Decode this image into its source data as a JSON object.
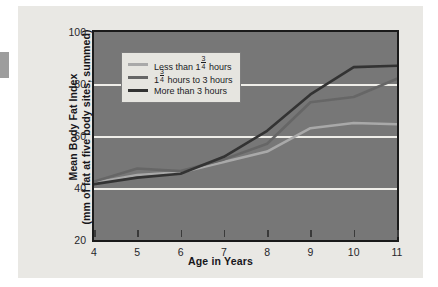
{
  "chart_data": {
    "type": "line",
    "title": "",
    "xlabel": "Age in Years",
    "ylabel": "Mean Body Fat Index (mm of fat at five body sites, summed)",
    "ylabel_line1": "Mean Body Fat Index",
    "ylabel_line2": "(mm of fat at five body sites, summed)",
    "x": [
      4,
      5,
      6,
      7,
      8,
      9,
      10,
      11
    ],
    "categories": [
      "4",
      "5",
      "6",
      "7",
      "8",
      "9",
      "10",
      "11"
    ],
    "xlim": [
      4,
      11
    ],
    "ylim": [
      20,
      100
    ],
    "yticks": [
      20,
      40,
      60,
      80,
      100
    ],
    "xticks": [
      4,
      5,
      6,
      7,
      8,
      9,
      10,
      11
    ],
    "grid": true,
    "grid_axis": "y",
    "legend_position": "upper-left-inside",
    "plot_background": "#777777",
    "figure_background": "#e9e8e4",
    "gridline_color": "#efeee9",
    "series": [
      {
        "name": "Less than 1¾ hours",
        "label_prefix": "Less than 1",
        "label_fraction_numerator": "3",
        "label_fraction_denominator": "4",
        "label_suffix": " hours",
        "color": "#a9a9a9",
        "values": [
          42,
          45,
          46,
          50,
          54,
          63,
          65,
          64.5
        ]
      },
      {
        "name": "1¾ hours to 3 hours",
        "label_prefix": "1",
        "label_fraction_numerator": "3",
        "label_fraction_denominator": "4",
        "label_suffix": " hours to 3 hours",
        "color": "#666666",
        "values": [
          42.5,
          47.5,
          46.5,
          51,
          57,
          73,
          75,
          82
        ]
      },
      {
        "name": "More than 3 hours",
        "label_prefix": "More than 3 hours",
        "label_fraction_numerator": "",
        "label_fraction_denominator": "",
        "label_suffix": "",
        "color": "#333333",
        "values": [
          41.5,
          44,
          45.5,
          52,
          62,
          76,
          86.5,
          87
        ]
      }
    ]
  }
}
